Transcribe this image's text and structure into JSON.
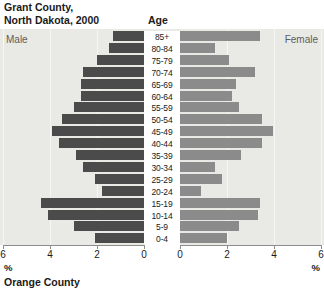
{
  "header": {
    "title": "Grant County,\nNorth Dakota, 2000",
    "age_column_header": "Age"
  },
  "legend": {
    "male_label": "Male",
    "female_label": "Female"
  },
  "axis": {
    "left_ticks": [
      "6",
      "4",
      "2",
      "0"
    ],
    "right_ticks": [
      "0",
      "2",
      "4",
      "6"
    ],
    "unit_left": "%",
    "unit_right": "%"
  },
  "footer": {
    "next_caption": "Orange County"
  },
  "colors": {
    "male_bar": "#4b4b4b",
    "female_bar": "#8b8b8b",
    "panel_bg": "#e9e9e6",
    "gridline": "#f6f6f4",
    "text": "#1a1a1a"
  },
  "chart_data": {
    "type": "bar",
    "subtype": "population-pyramid",
    "title": "Grant County, North Dakota, 2000",
    "xlabel": "%",
    "ylabel": "Age",
    "xlim": [
      0,
      6
    ],
    "grid": true,
    "legend_position": "inside-top-corners",
    "categories": [
      "85+",
      "80-84",
      "75-79",
      "70-74",
      "65-69",
      "60-64",
      "55-59",
      "50-54",
      "45-49",
      "40-44",
      "35-39",
      "30-34",
      "25-29",
      "20-24",
      "15-19",
      "10-14",
      "5-9",
      "0-4"
    ],
    "series": [
      {
        "name": "Male",
        "direction": "left",
        "color": "#4b4b4b",
        "values": [
          1.3,
          1.5,
          2.0,
          2.6,
          2.7,
          2.7,
          3.0,
          3.5,
          3.9,
          3.6,
          2.9,
          2.6,
          2.1,
          1.8,
          4.4,
          4.1,
          3.0,
          2.1
        ]
      },
      {
        "name": "Female",
        "direction": "right",
        "color": "#8b8b8b",
        "values": [
          3.4,
          1.5,
          2.1,
          3.2,
          2.4,
          2.2,
          2.5,
          3.5,
          3.95,
          3.5,
          2.6,
          1.5,
          1.8,
          0.9,
          3.4,
          3.3,
          2.5,
          2.0
        ]
      }
    ]
  }
}
